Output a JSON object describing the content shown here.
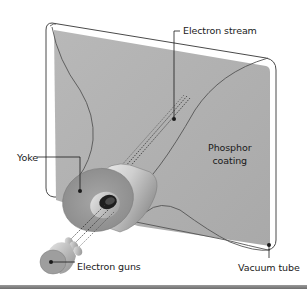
{
  "diagram": {
    "labels": {
      "electron_stream": "Electron stream",
      "phosphor_line1": "Phosphor",
      "phosphor_line2": "coating",
      "yoke": "Yoke",
      "electron_guns": "Electron guns",
      "vacuum_tube": "Vacuum tube"
    },
    "colors": {
      "screen": "#b4b4b4",
      "outline": "#4a4a4a",
      "yoke_face": "#9c9c9c",
      "yoke_side": "#d8d8d8",
      "gun": "#a8a8a8",
      "leader": "#1a1a1a",
      "bottom_bar": "#7a7a7a"
    }
  }
}
